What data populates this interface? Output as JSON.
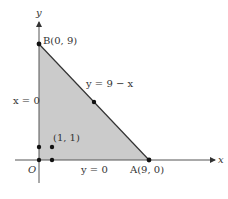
{
  "diagram": {
    "axes": {
      "x_label": "x",
      "y_label": "y",
      "origin_label": "O"
    },
    "points": {
      "B": "B(0, 9)",
      "A": "A(9, 0)",
      "P": "(1, 1)"
    },
    "lines": {
      "hypotenuse": "y = 9 − x",
      "left_edge": "x = 0",
      "bottom_edge": "y = 0"
    },
    "colors": {
      "fill": "#c9c9c9",
      "stroke": "#333333",
      "point": "#111111"
    }
  }
}
